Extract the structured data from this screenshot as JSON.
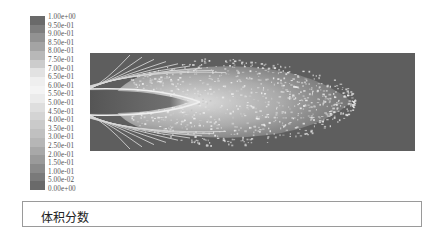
{
  "chart_data": {
    "type": "heatmap",
    "title": "",
    "caption": "体积分数",
    "colorbar": {
      "ticks": [
        "1.00e+00",
        "9.50e-01",
        "9.00e-01",
        "8.50e-01",
        "8.00e-01",
        "7.50e-01",
        "7.00e-01",
        "6.50e-01",
        "6.00e-01",
        "5.50e-01",
        "5.00e-01",
        "4.50e-01",
        "4.00e-01",
        "3.50e-01",
        "3.00e-01",
        "2.50e-01",
        "2.00e-01",
        "1.50e-01",
        "1.00e-01",
        "5.00e-02",
        "0.00e+00"
      ],
      "range": [
        0,
        1
      ],
      "colors": [
        "#6a6a6a",
        "#7e7e7e",
        "#929292",
        "#a4a4a4",
        "#b8b8b8",
        "#cccccc",
        "#e2e2e2",
        "#efefef",
        "#f4f4f4",
        "#ebebeb",
        "#dedede",
        "#d4d4d4",
        "#cacaca",
        "#c0c0c0",
        "#b6b6b6",
        "#a8a8a8",
        "#9a9a9a",
        "#8a8a8a",
        "#7a7a7a",
        "#6a6a6a"
      ]
    },
    "background_color": "#5e5e5e"
  },
  "caption": {
    "text": "体积分数"
  }
}
